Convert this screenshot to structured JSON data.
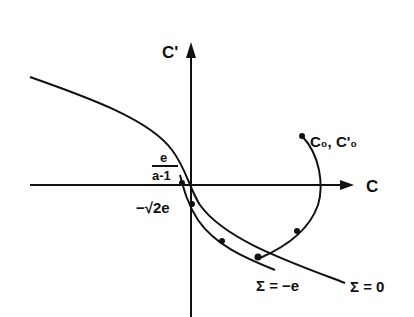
{
  "figure": {
    "axes": {
      "x_label": "C",
      "y_label": "C'"
    },
    "labels": {
      "frac_num": "e",
      "frac_den": "a-1",
      "neg_sqrt": "−√2e",
      "start_point": "C₀, C'₀",
      "sigma_neg": "Σ = −e",
      "sigma_zero": "Σ = 0"
    },
    "curves": [
      {
        "name": "Σ = 0",
        "description": "outer parabola-like curve from upper left through e/(a-1) on C axis to lower right"
      },
      {
        "name": "Σ = −e",
        "description": "inner curve through −√2e on C' axis, parallel to Σ = 0"
      },
      {
        "name": "trajectory",
        "description": "arc starting at (C₀, C'₀), crossing C axis and approaching Σ = −e curve"
      }
    ],
    "colors": {
      "ink": "#111111",
      "background": "#ffffff"
    }
  }
}
